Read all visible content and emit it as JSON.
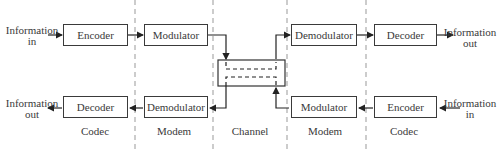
{
  "top_row": {
    "input_label": "Information\nin",
    "blocks": [
      "Encoder",
      "Modulator",
      "Demodulator",
      "Decoder"
    ],
    "output_label": "Information\nout"
  },
  "bottom_row": {
    "output_label": "Information\nout",
    "blocks": [
      "Decoder",
      "Demodulator",
      "Modulator",
      "Encoder"
    ],
    "input_label": "Information\nin"
  },
  "sections": [
    "Codec",
    "Modem",
    "Channel",
    "Modem",
    "Codec"
  ]
}
